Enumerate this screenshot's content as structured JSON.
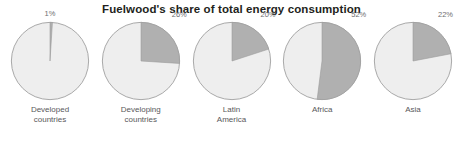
{
  "chart_data": {
    "type": "pie",
    "title": "Fuelwood's share of total energy consumption",
    "xlabel": "",
    "ylabel": "",
    "legend": "none",
    "grid": false,
    "units": "percent",
    "slice_color": "#b0b0b0",
    "remainder_color": "#eeeeee",
    "outline_color": "#9a9a9a",
    "background": "#ffffff",
    "categories": [
      "Developed countries",
      "Developing countries",
      "Latin America",
      "Africa",
      "Asia"
    ],
    "values": [
      1,
      26,
      20,
      52,
      22
    ],
    "panels": [
      {
        "label": "Developed\ncountries",
        "value": 1,
        "value_label": "1%",
        "label_position": "top-center"
      },
      {
        "label": "Developing\ncountries",
        "value": 26,
        "value_label": "26%",
        "label_position": "top-right"
      },
      {
        "label": "Latin\nAmerica",
        "value": 20,
        "value_label": "20%",
        "label_position": "top-right"
      },
      {
        "label": "Africa",
        "value": 52,
        "value_label": "52%",
        "label_position": "top-right"
      },
      {
        "label": "Asia",
        "value": 22,
        "value_label": "22%",
        "label_position": "top-right"
      }
    ]
  }
}
